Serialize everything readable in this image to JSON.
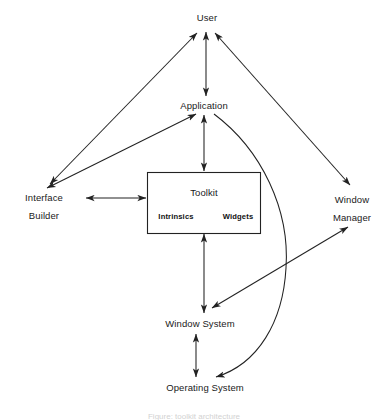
{
  "diagram": {
    "background_color": "#ffffff",
    "stroke_color": "#222222",
    "nodes": {
      "user": {
        "label": "User",
        "x": 207,
        "y": 18
      },
      "application": {
        "label": "Application",
        "x": 204,
        "y": 106
      },
      "interface_builder": {
        "line1": "Interface",
        "line2": "Builder",
        "x": 44,
        "y": 198
      },
      "window_manager": {
        "line1": "Window",
        "line2": "Manager",
        "x": 352,
        "y": 200
      },
      "toolkit": {
        "label": "Toolkit",
        "x": 204,
        "y": 193
      },
      "intrinsics": {
        "label": "Intrinsics",
        "x": 176,
        "y": 216
      },
      "widgets": {
        "label": "Widgets",
        "x": 238,
        "y": 216
      },
      "window_system": {
        "label": "Window System",
        "x": 200,
        "y": 324
      },
      "operating_system": {
        "label": "Operating System",
        "x": 205,
        "y": 388
      }
    },
    "toolkit_box": {
      "x": 147,
      "y": 172,
      "width": 113,
      "height": 61
    },
    "edges": [
      {
        "name": "interface-builder-to-user",
        "type": "double-arrow-line"
      },
      {
        "name": "user-to-window-manager",
        "type": "double-arrow-line"
      },
      {
        "name": "user-to-application",
        "type": "double-arrow-line"
      },
      {
        "name": "interface-builder-to-application",
        "type": "double-arrow-line"
      },
      {
        "name": "interface-builder-to-toolkit",
        "type": "double-arrow-line"
      },
      {
        "name": "application-to-toolkit",
        "type": "double-arrow-line"
      },
      {
        "name": "toolkit-to-window-system",
        "type": "double-arrow-line"
      },
      {
        "name": "window-system-to-window-manager",
        "type": "double-arrow-line"
      },
      {
        "name": "window-system-to-operating-system",
        "type": "double-arrow-line"
      },
      {
        "name": "application-to-operating-system",
        "type": "curved-arrow"
      }
    ],
    "caption": "Figure: toolkit architecture"
  }
}
